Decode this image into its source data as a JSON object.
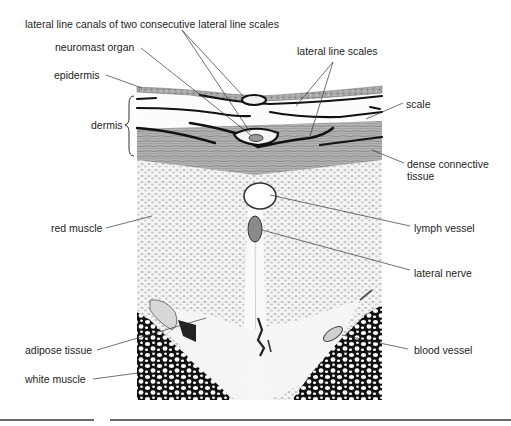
{
  "diagram": {
    "type": "histological cross-section illustration",
    "labels": {
      "lateral_line_canals": "lateral line canals of two consecutive lateral line scales",
      "neuromast_organ": "neuromast organ",
      "lateral_line_scales": "lateral line scales",
      "epidermis": "epidermis",
      "dermis": "dermis",
      "scale": "scale",
      "dense_connective_tissue_1": "dense connective",
      "dense_connective_tissue_2": "tissue",
      "red_muscle": "red muscle",
      "lymph_vessel": "lymph vessel",
      "lateral_nerve": "lateral nerve",
      "adipose_tissue": "adipose tissue",
      "blood_vessel": "blood vessel",
      "white_muscle": "white muscle"
    },
    "colors": {
      "ink": "#1e1e1e",
      "leader_line": "#333333",
      "epidermis_fill": "#9a9a9a",
      "connective_fill": "#8f8f8f",
      "red_muscle_fill": "#e6e6e6",
      "white_muscle_fill": "#111111"
    }
  }
}
